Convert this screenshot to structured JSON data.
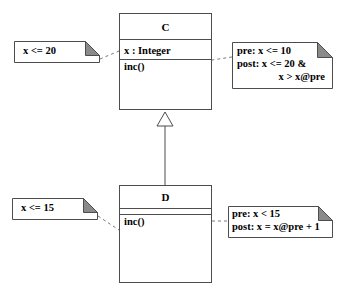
{
  "diagram": {
    "type": "uml-class-diagram",
    "background_color": "#ffffff",
    "line_color": "#4d4d4d",
    "fold_color": "#808080",
    "text_color": "#000000",
    "classes": [
      {
        "id": "class-c",
        "name": "C",
        "attributes": [
          "x : Integer"
        ],
        "operations": [
          "inc()"
        ]
      },
      {
        "id": "class-d",
        "name": "D",
        "attributes": [],
        "operations": [
          "inc()"
        ]
      }
    ],
    "relationship": {
      "kind": "generalization",
      "label": "D inherits from C",
      "from": "D",
      "to": "C"
    },
    "notes": [
      {
        "id": "note-c-invariant",
        "lines": [
          "x <= 20"
        ],
        "attached_to": "class-c",
        "position": "left"
      },
      {
        "id": "note-c-contract",
        "lines": [
          "pre: x <= 10",
          "post: x <= 20 &",
          "x > x@pre"
        ],
        "line3_indented": true,
        "attached_to": "class-c-inc",
        "position": "right"
      },
      {
        "id": "note-d-invariant",
        "lines": [
          "x <= 15"
        ],
        "attached_to": "class-d",
        "position": "left"
      },
      {
        "id": "note-d-contract",
        "lines": [
          "pre: x < 15",
          "post: x = x@pre + 1"
        ],
        "attached_to": "class-d-inc",
        "position": "right"
      }
    ]
  }
}
